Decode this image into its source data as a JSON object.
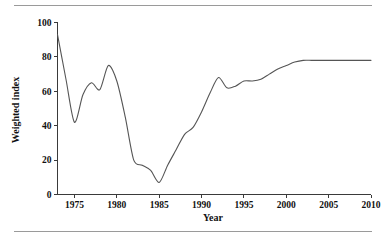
{
  "figure": {
    "background_color": "#ffffff",
    "rule_color": "#9a9a9a",
    "line_color": "#555555",
    "axis_color": "#3a3a3a"
  },
  "chart_data": {
    "type": "line",
    "title": "",
    "subtitle": "",
    "xlabel": "Year",
    "ylabel": "Weighted index",
    "xlim": [
      1973,
      2010
    ],
    "ylim": [
      0,
      100
    ],
    "grid": false,
    "legend": null,
    "xticks": [
      1975,
      1980,
      1985,
      1990,
      1995,
      2000,
      2005,
      2010
    ],
    "xtick_labels": [
      "1975",
      "1980",
      "1985",
      "1990",
      "1995",
      "2000",
      "2005",
      "2010"
    ],
    "yticks": [
      0,
      20,
      40,
      60,
      80,
      100
    ],
    "ytick_labels": [
      "0",
      "20",
      "40",
      "60",
      "80",
      "100"
    ],
    "series": [
      {
        "name": "Weighted index",
        "color": "#555555",
        "x": [
          1973,
          1974,
          1975,
          1976,
          1977,
          1978,
          1979,
          1980,
          1981,
          1982,
          1983,
          1984,
          1985,
          1986,
          1987,
          1988,
          1989,
          1990,
          1991,
          1992,
          1993,
          1994,
          1995,
          1996,
          1997,
          1998,
          1999,
          2000,
          2001,
          2002,
          2003,
          2004,
          2005,
          2006,
          2007,
          2008,
          2009,
          2010
        ],
        "values": [
          93,
          67,
          42,
          58,
          65,
          61,
          75,
          66,
          45,
          20,
          17,
          14,
          7,
          17,
          26,
          35,
          39,
          48,
          59,
          68,
          62,
          63,
          66,
          66,
          67,
          70,
          73,
          75,
          77,
          78,
          78,
          78,
          78,
          78,
          78,
          78,
          78,
          78
        ]
      }
    ],
    "annotations": []
  }
}
